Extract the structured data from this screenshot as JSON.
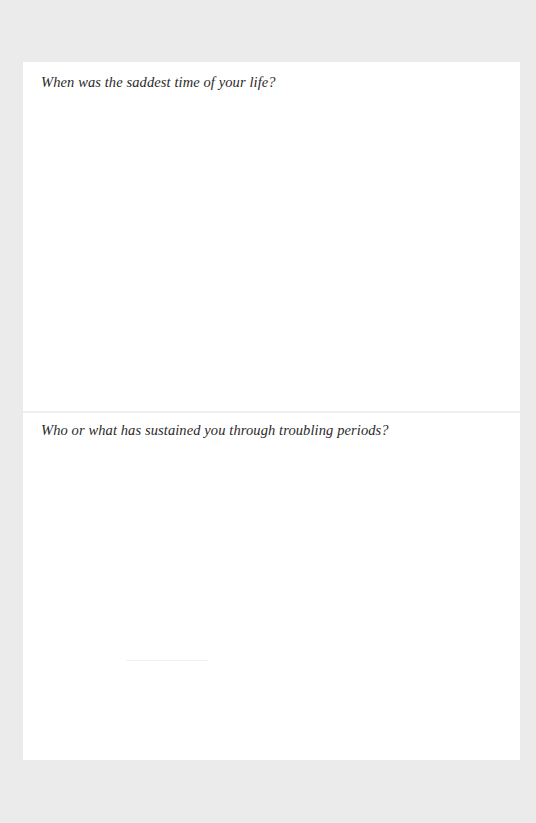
{
  "page": {
    "background_color": "#ebebeb",
    "panel_color": "#ffffff",
    "text_color": "#2a2a2a"
  },
  "sections": [
    {
      "prompt": "When was the saddest time of your life?",
      "answer": ""
    },
    {
      "prompt": "Who or what has sustained you through troubling periods?",
      "answer": ""
    }
  ]
}
